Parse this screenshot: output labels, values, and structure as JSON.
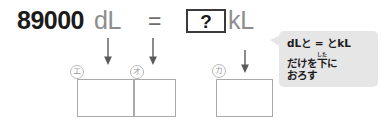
{
  "equation": {
    "left_number": "89000",
    "left_unit": "dL",
    "equals": "=",
    "answer_placeholder": "?",
    "right_unit": "kL"
  },
  "markers": [
    {
      "id": "e",
      "label": "エ"
    },
    {
      "id": "o",
      "label": "オ"
    },
    {
      "id": "ka",
      "label": "カ"
    }
  ],
  "arrows": [
    {
      "id": "arrow-to-box-e",
      "direction": "down"
    },
    {
      "id": "arrow-to-box-o",
      "direction": "down"
    },
    {
      "id": "arrow-to-box-ka",
      "direction": "down"
    }
  ],
  "answer_boxes": [
    {
      "id": "box-e",
      "value": ""
    },
    {
      "id": "box-o",
      "value": ""
    },
    {
      "id": "box-ka",
      "value": ""
    }
  ],
  "hint_bubble": {
    "line1_a": "dLと = とkL",
    "line2_a": "だけを",
    "line2_kanji": "下",
    "line2_furigana": "した",
    "line2_b": "に",
    "line3": "おろす"
  },
  "colors": {
    "number": "#1b1b1b",
    "unit_gray": "#8d8d8d",
    "box_border": "#a9a9a9",
    "qbox_border": "#3a3a3a",
    "bubble_bg": "#e6e6e6",
    "arrow": "#5a5a5a",
    "marker_border": "#b9b9b9"
  }
}
